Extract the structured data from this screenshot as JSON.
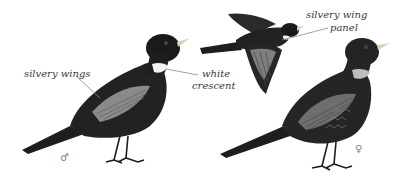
{
  "illustration": {
    "subject": "bird field-guide plate",
    "figures": [
      {
        "id": "male-standing",
        "sex_symbol": "♂"
      },
      {
        "id": "flying"
      },
      {
        "id": "female-standing",
        "sex_symbol": "♀"
      }
    ],
    "annotations": {
      "silvery_wings": "silvery wings",
      "white_crescent_line1": "white",
      "white_crescent_line2": "crescent",
      "silvery_wing_panel_line1": "silvery wing",
      "silvery_wing_panel_line2": "panel"
    },
    "symbols": {
      "male": "♂",
      "female": "♀"
    },
    "colors": {
      "background": "#ffffff",
      "bird_dark": "#1e1e1e",
      "bird_mid": "#3a3a3a",
      "wing_silver": "#8a8a8a",
      "crescent_white": "#f2f2f2",
      "female_crescent": "#bdbdbd",
      "beak": "#d8d2b8",
      "leader_line": "#8c8c8c",
      "text": "#3a3a3a"
    }
  }
}
